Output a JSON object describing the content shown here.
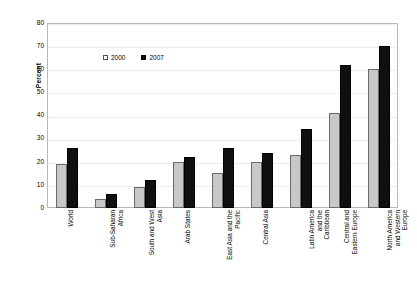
{
  "chart_data": {
    "type": "bar",
    "title": "",
    "subtitle": "",
    "xlabel": "",
    "ylabel": "Percent",
    "ylim": [
      0,
      80
    ],
    "yticks": [
      0,
      10,
      20,
      30,
      40,
      50,
      60,
      70,
      80
    ],
    "grid": true,
    "legend_position": "inside-top-left",
    "categories": [
      "World",
      "Sub-Saharan\nAfrica",
      "South and West\nAsia",
      "Arab States",
      "East Asia and the\nPacific",
      "Central Asia",
      "Latin America\nand the\nCaribbean",
      "Central and\nEastern Europe",
      "North America\nand Western\nEurope"
    ],
    "series": [
      {
        "name": "2000",
        "color": "#c8c8c8",
        "values": [
          19,
          4,
          9,
          20,
          15,
          20,
          23,
          41,
          60
        ]
      },
      {
        "name": "2007",
        "color": "#101010",
        "values": [
          26,
          6,
          12,
          22,
          26,
          24,
          34,
          62,
          70
        ]
      }
    ]
  },
  "legend": {
    "entries": [
      {
        "label": "2000"
      },
      {
        "label": "2007"
      }
    ]
  },
  "axis": {
    "y_title": "Percent"
  }
}
